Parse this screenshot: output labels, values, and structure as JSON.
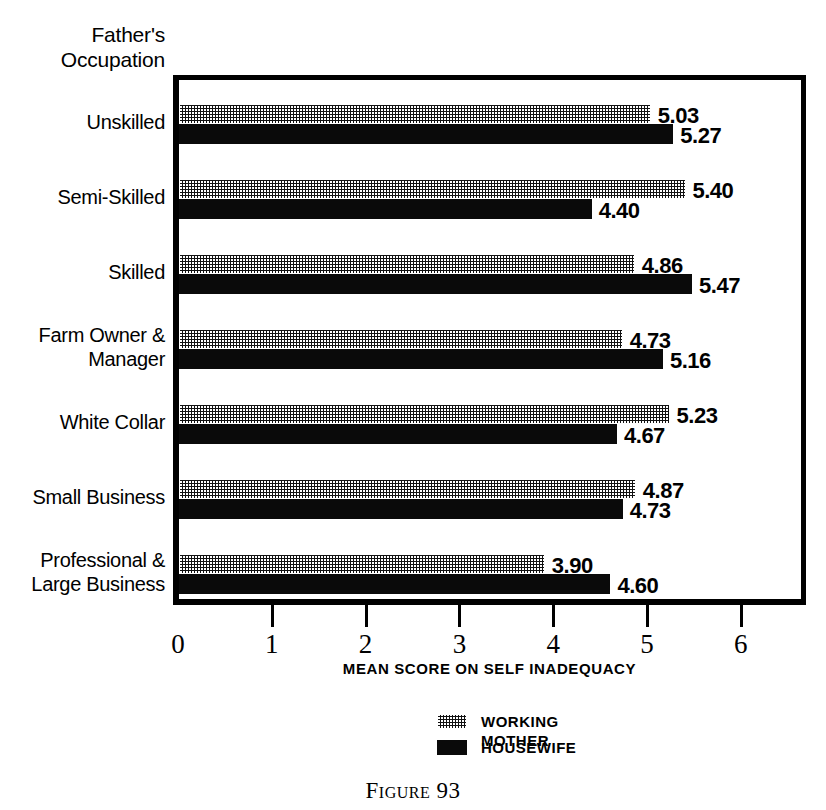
{
  "axis_title": "Father's\nOccupation",
  "figure_caption": "Figure 93",
  "legend": [
    {
      "label": "WORKING MOTHER",
      "pattern": "hatch"
    },
    {
      "label": "HOUSEWIFE",
      "pattern": "solid"
    }
  ],
  "chart_data": {
    "type": "bar",
    "orientation": "horizontal",
    "title": "Father's Occupation",
    "xlabel": "MEAN SCORE ON SELF INADEQUACY",
    "ylabel": "Father's Occupation",
    "xlim": [
      0,
      6
    ],
    "ticks": [
      "0",
      "1",
      "2",
      "3",
      "4",
      "5",
      "6"
    ],
    "grid": false,
    "legend_position": "bottom-center",
    "categories": [
      "Unskilled",
      "Semi-Skilled",
      "Skilled",
      "Farm Owner &\nManager",
      "White Collar",
      "Small Business",
      "Professional &\nLarge Business"
    ],
    "series": [
      {
        "name": "WORKING MOTHER",
        "pattern": "hatch",
        "values": [
          5.03,
          5.4,
          4.86,
          4.73,
          5.23,
          4.87,
          3.9
        ],
        "labels": [
          "5.03",
          "5.40",
          "4.86",
          "4.73",
          "5.23",
          "4.87",
          "3.90"
        ]
      },
      {
        "name": "HOUSEWIFE",
        "pattern": "solid",
        "values": [
          5.27,
          4.4,
          5.47,
          5.16,
          4.67,
          4.73,
          4.6
        ],
        "labels": [
          "5.27",
          "4.40",
          "5.47",
          "5.16",
          "4.67",
          "4.73",
          "4.60"
        ]
      }
    ]
  }
}
